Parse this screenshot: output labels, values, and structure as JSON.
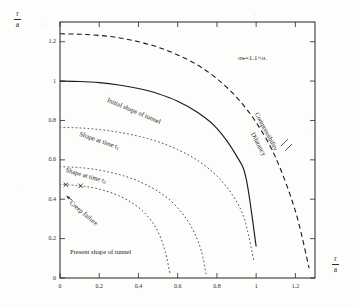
{
  "figure": {
    "y_axis_label_numerator": "r",
    "y_axis_label_denominator": "a",
    "x_axis_label_numerator": "r",
    "x_axis_label_denominator": "a",
    "stress_annotation": "σₕ=1.1×σᵥ",
    "stress_annotation_plain": "σh=1.1×σv"
  },
  "annotations": {
    "initial_shape": "Initial shape of tunnel",
    "shape_t1": "Shape at time t",
    "shape_t1_sub": "1",
    "shape_t2": "Shape at time t",
    "shape_t2_sub": "2",
    "creep_failure": "Creep failure",
    "present_shape": "Present shape of tunnel",
    "compressibility": "Compressibility",
    "dilatancy": "Dilatancy"
  },
  "chart_data": {
    "type": "line",
    "title": "",
    "subtitle": "",
    "xlabel": "r/a",
    "ylabel": "r/a",
    "xlim": [
      0,
      1.3
    ],
    "ylim": [
      0,
      1.3
    ],
    "grid": false,
    "legend_position": "inline-curve-labels",
    "xticks": [
      "0",
      "0.2",
      "0.4",
      "0.6",
      "0.8",
      "1",
      "1.2"
    ],
    "xtick_values": [
      0,
      0.2,
      0.4,
      0.6,
      0.8,
      1.0,
      1.2
    ],
    "yticks": [
      "0",
      "0.2",
      "0.4",
      "0.6",
      "0.8",
      "1",
      "1.2"
    ],
    "ytick_values": [
      0,
      0.2,
      0.4,
      0.6,
      0.8,
      1.0,
      1.2
    ],
    "series": [
      {
        "name": "Compressibility / Dilatancy boundary",
        "style": "dashed",
        "color": "#1a1a1a",
        "x": [
          0.0,
          0.1,
          0.2,
          0.3,
          0.4,
          0.5,
          0.6,
          0.7,
          0.8,
          0.9,
          1.0,
          1.1,
          1.2,
          1.27
        ],
        "y": [
          1.24,
          1.238,
          1.232,
          1.22,
          1.2,
          1.172,
          1.133,
          1.082,
          1.012,
          0.918,
          0.79,
          0.61,
          0.34,
          0.05
        ]
      },
      {
        "name": "Initial shape of tunnel",
        "style": "solid",
        "color": "#1a1a1a",
        "x": [
          0.0,
          0.1,
          0.2,
          0.3,
          0.4,
          0.5,
          0.6,
          0.7,
          0.8,
          0.9,
          0.95,
          1.0
        ],
        "y": [
          1.0,
          0.998,
          0.992,
          0.98,
          0.962,
          0.936,
          0.898,
          0.842,
          0.76,
          0.62,
          0.5,
          0.16
        ]
      },
      {
        "name": "Shape at time t1",
        "style": "dotted",
        "color": "#4a4a4a",
        "x": [
          0.0,
          0.1,
          0.2,
          0.3,
          0.4,
          0.5,
          0.6,
          0.7,
          0.8,
          0.88,
          0.94,
          0.99
        ],
        "y": [
          0.765,
          0.762,
          0.754,
          0.74,
          0.72,
          0.692,
          0.652,
          0.598,
          0.518,
          0.42,
          0.3,
          0.08
        ]
      },
      {
        "name": "Shape at time t2",
        "style": "dotted",
        "color": "#4a4a4a",
        "x": [
          0.0,
          0.08,
          0.16,
          0.24,
          0.32,
          0.4,
          0.48,
          0.56,
          0.63,
          0.68,
          0.72,
          0.745
        ],
        "y": [
          0.565,
          0.562,
          0.554,
          0.54,
          0.52,
          0.492,
          0.452,
          0.396,
          0.32,
          0.24,
          0.14,
          0.02
        ]
      },
      {
        "name": "Present shape of tunnel (creep failure)",
        "style": "dotted",
        "color": "#4a4a4a",
        "markers": "x",
        "x": [
          0.0,
          0.06,
          0.12,
          0.18,
          0.24,
          0.3,
          0.36,
          0.42,
          0.47,
          0.51,
          0.54,
          0.562
        ],
        "y": [
          0.475,
          0.472,
          0.466,
          0.456,
          0.44,
          0.418,
          0.386,
          0.342,
          0.284,
          0.212,
          0.12,
          0.015
        ],
        "marker_x": [
          0.03,
          0.105
        ],
        "marker_y": [
          0.474,
          0.468
        ]
      }
    ]
  }
}
